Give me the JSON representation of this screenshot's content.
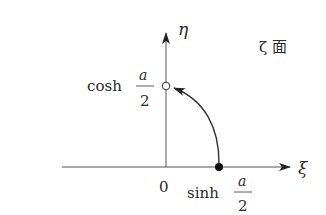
{
  "diagram": {
    "plane_label": "ζ 面",
    "axes": {
      "horizontal_label": "ξ",
      "vertical_label": "η",
      "origin_label": "0"
    },
    "points": [
      {
        "name": "start",
        "style": "filled",
        "label_func": "sinh",
        "label_num": "a",
        "label_den": "2"
      },
      {
        "name": "end",
        "style": "open",
        "label_func": "cosh",
        "label_num": "a",
        "label_den": "2"
      }
    ],
    "curve": {
      "from": "start",
      "to": "end",
      "arrow": "end"
    },
    "colors": {
      "ink": "#2a2a2a",
      "axis": "#555555",
      "background": "#ffffff"
    }
  }
}
